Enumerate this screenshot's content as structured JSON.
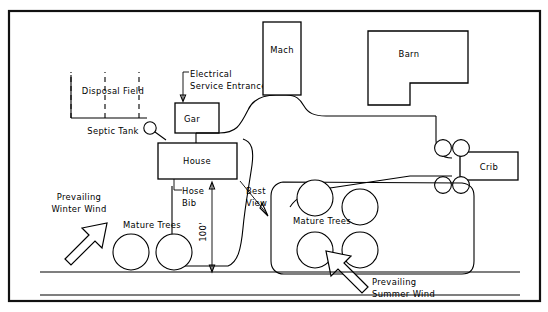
{
  "diagram": {
    "frame": {
      "border_color": "#111111",
      "background": "#ffffff"
    },
    "buildings": [
      {
        "id": "house",
        "label": "House"
      },
      {
        "id": "garage",
        "label": "Gar"
      },
      {
        "id": "machine-shed",
        "label": "Mach"
      },
      {
        "id": "barn",
        "label": "Barn"
      },
      {
        "id": "crib",
        "label": "Crib"
      }
    ],
    "features": [
      {
        "id": "disposal-field",
        "label": "Disposal Field"
      },
      {
        "id": "septic-tank",
        "label": "Septic Tank"
      },
      {
        "id": "electrical-service-entrance",
        "label_line1": "Electrical",
        "label_line2": "Service Entrance"
      },
      {
        "id": "hose-bib",
        "label_line1": "Hose",
        "label_line2": "Bib"
      },
      {
        "id": "best-view",
        "label_line1": "Best",
        "label_line2": "View"
      },
      {
        "id": "mature-trees-left",
        "label": "Mature Trees"
      },
      {
        "id": "mature-trees-right",
        "label": "Mature Trees"
      }
    ],
    "dimensions": [
      {
        "id": "setback-dimension",
        "label": "100'"
      }
    ],
    "wind_arrows": [
      {
        "id": "prevailing-winter-wind",
        "label_line1": "Prevailing",
        "label_line2": "Winter Wind",
        "direction": "northeast"
      },
      {
        "id": "prevailing-summer-wind",
        "label_line1": "Prevailing",
        "label_line2": "Summer Wind",
        "direction": "northwest"
      }
    ],
    "road": {
      "id": "road",
      "label": ""
    }
  }
}
